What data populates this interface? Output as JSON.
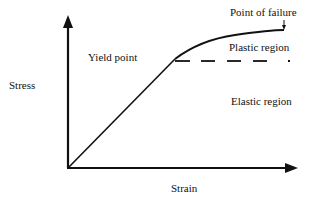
{
  "diagram": {
    "axes": {
      "y_label": "Stress",
      "x_label": "Strain"
    },
    "annotations": {
      "yield_point": "Yield point",
      "point_of_failure": "Point of failure",
      "plastic_region": "Plastic region",
      "elastic_region": "Elastic region"
    },
    "colors": {
      "line": "#111111",
      "background": "#ffffff"
    }
  }
}
